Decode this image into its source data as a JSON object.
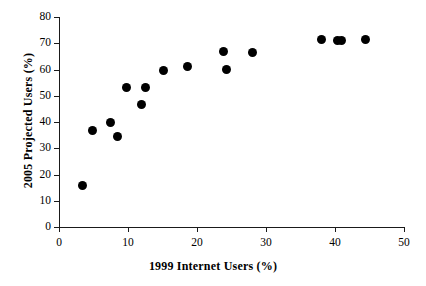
{
  "chart_data": {
    "type": "scatter",
    "title": "",
    "xlabel": "1999 Internet Users (%)",
    "ylabel": "2005 Projected Users (%)",
    "xlim": [
      0,
      50
    ],
    "ylim": [
      0,
      80
    ],
    "xticks": [
      0,
      10,
      20,
      30,
      40,
      50
    ],
    "yticks": [
      0,
      10,
      20,
      30,
      40,
      50,
      60,
      70,
      80
    ],
    "xtick_labels": [
      "0",
      "10",
      "20",
      "30",
      "40",
      "50"
    ],
    "ytick_labels": [
      "0",
      "10",
      "20",
      "30",
      "40",
      "50",
      "60",
      "70",
      "80"
    ],
    "grid": false,
    "legend": null,
    "marker": {
      "shape": "circle",
      "color": "#000000",
      "size_px": 9
    },
    "series": [
      {
        "name": "Countries",
        "points": [
          {
            "x": 3.4,
            "y": 16.0
          },
          {
            "x": 4.8,
            "y": 36.8
          },
          {
            "x": 7.4,
            "y": 40.0
          },
          {
            "x": 8.5,
            "y": 34.5
          },
          {
            "x": 9.8,
            "y": 53.0
          },
          {
            "x": 12.0,
            "y": 46.7
          },
          {
            "x": 12.5,
            "y": 53.3
          },
          {
            "x": 15.1,
            "y": 59.5
          },
          {
            "x": 18.6,
            "y": 61.2
          },
          {
            "x": 23.9,
            "y": 66.7
          },
          {
            "x": 24.3,
            "y": 60.0
          },
          {
            "x": 28.1,
            "y": 66.5
          },
          {
            "x": 38.0,
            "y": 71.4
          },
          {
            "x": 40.4,
            "y": 71.1
          },
          {
            "x": 41.0,
            "y": 71.1
          },
          {
            "x": 44.4,
            "y": 71.6
          }
        ]
      }
    ]
  }
}
